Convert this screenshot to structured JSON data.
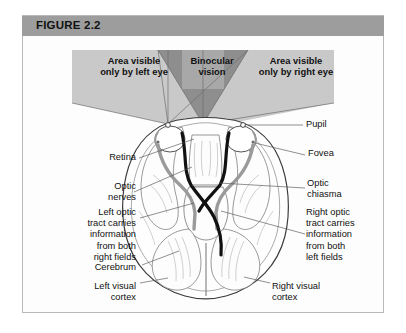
{
  "figure": {
    "header_label": "FIGURE 2.2",
    "header_bg": "#9d9d9d",
    "frame_border": "#b9b9b9",
    "page_bg": "#ffffff",
    "panel_bg": "#fdfdfd"
  },
  "visual_field": {
    "left_area": "Area visible\nonly by left eye",
    "binocular": "Binocular\nvision",
    "right_area": "Area visible\nonly by right eye",
    "shade_light": "#c9c9c9",
    "shade_dark": "#8e8e8e"
  },
  "callouts": {
    "pupil": "Pupil",
    "fovea": "Fovea",
    "retina": "Retina",
    "optic_nerves": "Optic\nnerves",
    "optic_chiasma": "Optic\nchiasma",
    "left_optic_tract": "Left optic\ntract carries\ninformation\nfrom both\nright fields",
    "right_optic_tract": "Right optic\ntract carries\ninformation\nfrom both\nleft fields",
    "cerebrum": "Cerebrum",
    "left_visual_cortex": "Left visual\ncortex",
    "right_visual_cortex": "Right visual\ncortex"
  },
  "diagram": {
    "outline_color": "#3a3a3a",
    "tract_dark": "#111111",
    "tract_grey": "#9a9a9a",
    "leader_color": "#555555"
  }
}
